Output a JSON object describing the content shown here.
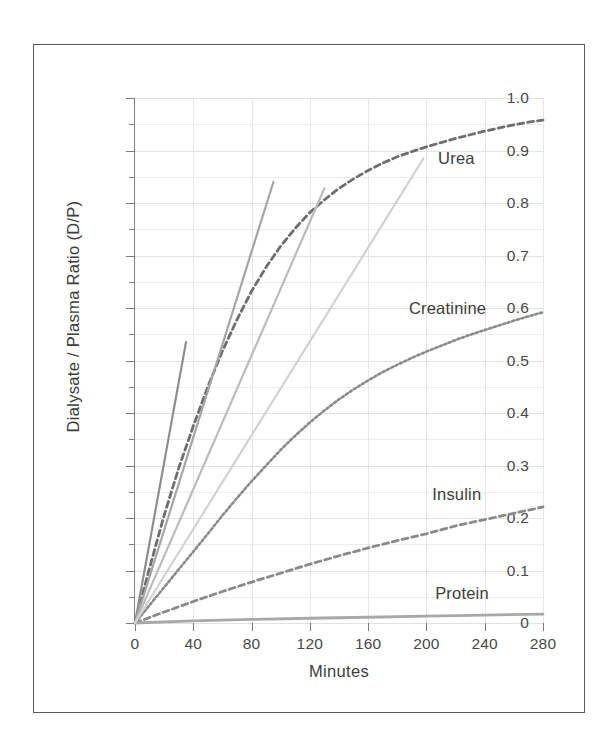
{
  "figure": {
    "background": "#ffffff",
    "border_color": "#5a5a5a"
  },
  "chart_data": {
    "type": "line",
    "title": "",
    "xlabel": "Minutes",
    "ylabel": "Dialysate / Plasma Ratio (D/P)",
    "xlim": [
      0,
      280
    ],
    "ylim": [
      0,
      1.0
    ],
    "x_ticks": [
      0,
      40,
      80,
      120,
      160,
      200,
      240,
      280
    ],
    "x_tick_labels": [
      "0",
      "40",
      "80",
      "120",
      "160",
      "200",
      "240",
      "280"
    ],
    "y_ticks": [
      0,
      0.1,
      0.2,
      0.3,
      0.4,
      0.5,
      0.6,
      0.7,
      0.8,
      0.9,
      1.0
    ],
    "y_tick_labels": [
      "0",
      "0.1",
      "0.2",
      "0.3",
      "0.4",
      "0.5",
      "0.6",
      "0.7",
      "0.8",
      "0.9",
      "1.0"
    ],
    "y_minor_ticks": [
      0.05,
      0.15,
      0.25,
      0.35,
      0.45,
      0.55,
      0.65,
      0.75,
      0.85,
      0.95
    ],
    "grid": true,
    "grid_color": "#e6e6e6",
    "legend": "inline-labels",
    "annotations": [
      {
        "text": "Urea",
        "x": 208,
        "y": 0.885,
        "color": "#3d3d3d"
      },
      {
        "text": "Creatinine",
        "x": 188,
        "y": 0.6,
        "color": "#3d3d3d"
      },
      {
        "text": "Insulin",
        "x": 204,
        "y": 0.245,
        "color": "#3d3d3d"
      },
      {
        "text": "Protein",
        "x": 206,
        "y": 0.058,
        "color": "#3d3d3d"
      }
    ],
    "series": [
      {
        "name": "Urea",
        "style": "dashed",
        "color": "#6e6e6e",
        "x": [
          0,
          10,
          20,
          30,
          40,
          50,
          60,
          70,
          80,
          90,
          100,
          110,
          120,
          130,
          140,
          150,
          160,
          170,
          180,
          190,
          200,
          210,
          220,
          230,
          240,
          250,
          260,
          270,
          280
        ],
        "y": [
          0,
          0.105,
          0.205,
          0.295,
          0.375,
          0.45,
          0.518,
          0.578,
          0.632,
          0.678,
          0.718,
          0.752,
          0.782,
          0.806,
          0.828,
          0.846,
          0.862,
          0.876,
          0.888,
          0.898,
          0.907,
          0.915,
          0.923,
          0.93,
          0.937,
          0.943,
          0.949,
          0.954,
          0.958
        ]
      },
      {
        "name": "Creatinine",
        "style": "dotted",
        "color": "#8a8a8a",
        "x": [
          0,
          10,
          20,
          30,
          40,
          50,
          60,
          70,
          80,
          90,
          100,
          110,
          120,
          130,
          140,
          150,
          160,
          170,
          180,
          190,
          200,
          210,
          220,
          230,
          240,
          250,
          260,
          270,
          280
        ],
        "y": [
          0,
          0.034,
          0.068,
          0.102,
          0.136,
          0.17,
          0.205,
          0.238,
          0.27,
          0.3,
          0.33,
          0.357,
          0.382,
          0.405,
          0.426,
          0.445,
          0.462,
          0.478,
          0.492,
          0.505,
          0.517,
          0.528,
          0.539,
          0.549,
          0.558,
          0.567,
          0.576,
          0.584,
          0.592
        ]
      },
      {
        "name": "Insulin",
        "style": "dashed",
        "color": "#8a8a8a",
        "x": [
          0,
          20,
          40,
          60,
          80,
          100,
          120,
          140,
          160,
          180,
          200,
          220,
          240,
          260,
          280
        ],
        "y": [
          0,
          0.021,
          0.041,
          0.06,
          0.078,
          0.095,
          0.112,
          0.128,
          0.143,
          0.157,
          0.17,
          0.185,
          0.197,
          0.209,
          0.221
        ]
      },
      {
        "name": "Protein",
        "style": "solid",
        "color": "#a8a8a8",
        "x": [
          0,
          40,
          80,
          120,
          160,
          200,
          240,
          280
        ],
        "y": [
          0,
          0.004,
          0.007,
          0.009,
          0.011,
          0.013,
          0.015,
          0.017
        ]
      },
      {
        "name": "steep-line-1",
        "style": "solid",
        "color": "#8e8e8e",
        "x": [
          0,
          35
        ],
        "y": [
          0,
          0.535
        ]
      },
      {
        "name": "steep-line-2",
        "style": "solid",
        "color": "#a5a5a5",
        "x": [
          0,
          95
        ],
        "y": [
          0,
          0.84
        ]
      },
      {
        "name": "steep-line-3",
        "style": "solid",
        "color": "#bcbcbc",
        "x": [
          0,
          130
        ],
        "y": [
          0,
          0.828
        ]
      },
      {
        "name": "steep-line-4",
        "style": "solid",
        "color": "#d2d2d2",
        "x": [
          0,
          198
        ],
        "y": [
          0,
          0.885
        ]
      }
    ]
  }
}
